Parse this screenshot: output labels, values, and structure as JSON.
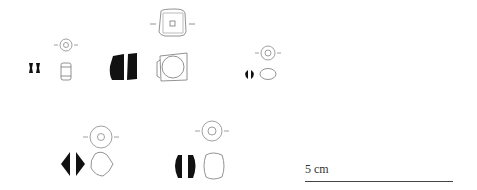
{
  "figure": {
    "type": "archaeological bead illustration",
    "bead_count": 5,
    "beads": [
      {
        "id": "bead-1",
        "shape": "small cylindrical bead",
        "views": [
          "section",
          "profile",
          "top"
        ]
      },
      {
        "id": "bead-2",
        "shape": "large square/barrel bead",
        "views": [
          "section",
          "profile",
          "top"
        ]
      },
      {
        "id": "bead-3",
        "shape": "small oblate bead",
        "views": [
          "section",
          "profile",
          "top"
        ]
      },
      {
        "id": "bead-4",
        "shape": "biconical bead",
        "views": [
          "section",
          "profile",
          "top"
        ]
      },
      {
        "id": "bead-5",
        "shape": "barrel bead",
        "views": [
          "section",
          "profile",
          "top"
        ]
      }
    ],
    "colors": {
      "ink": "#111111",
      "outline": "#777777",
      "background": "#ffffff"
    }
  },
  "scale": {
    "label": "5 cm"
  }
}
